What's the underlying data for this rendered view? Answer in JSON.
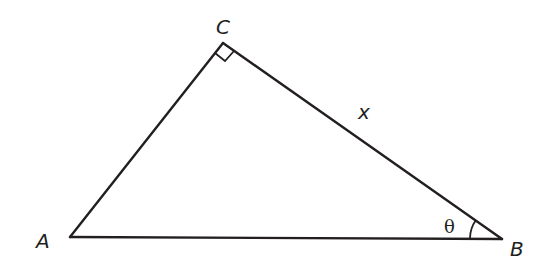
{
  "diagram": {
    "type": "right-triangle",
    "vertices": {
      "A": {
        "label": "A"
      },
      "B": {
        "label": "B"
      },
      "C": {
        "label": "C"
      }
    },
    "right_angle_at": "C",
    "side_labels": {
      "CB": "x"
    },
    "angle_labels": {
      "B": "θ"
    },
    "colors": {
      "stroke": "#231f20",
      "background": "#ffffff"
    }
  }
}
